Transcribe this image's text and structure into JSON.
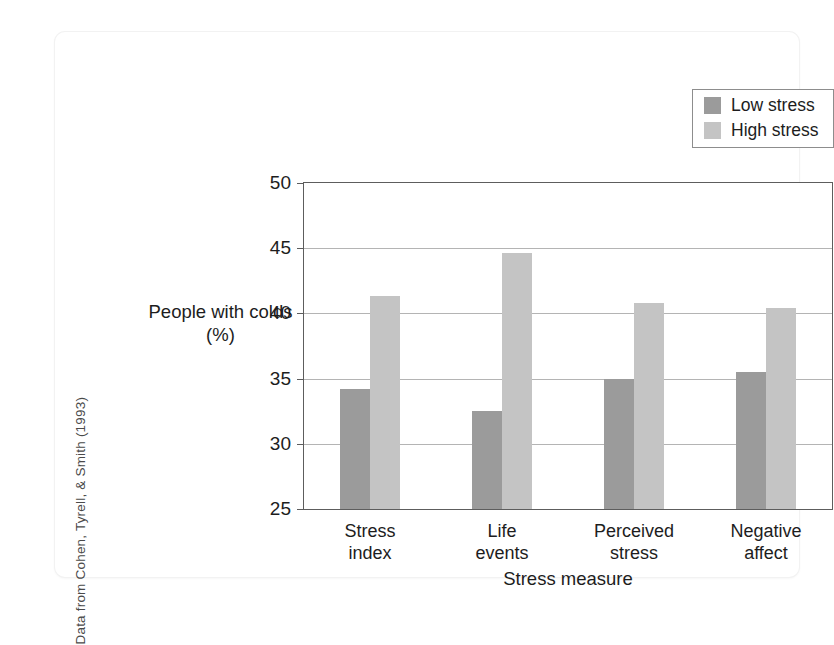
{
  "source_credit": "Data from Cohen, Tyrell, & Smith (1993)",
  "legend": {
    "position": "top-right",
    "items": [
      {
        "label": "Low stress",
        "color": "#9b9b9b",
        "swatch_name": "legend-swatch-low-stress"
      },
      {
        "label": "High stress",
        "color": "#c4c4c4",
        "swatch_name": "legend-swatch-high-stress"
      }
    ]
  },
  "chart_data": {
    "type": "bar",
    "title": "",
    "subtitle": "",
    "xlabel": "Stress measure",
    "ylabel": "People with colds (%)",
    "categories": [
      "Stress\nindex",
      "Life\nevents",
      "Perceived\nstress",
      "Negative\naffect"
    ],
    "category_labels": [
      {
        "line1": "Stress",
        "line2": "index"
      },
      {
        "line1": "Life",
        "line2": "events"
      },
      {
        "line1": "Perceived",
        "line2": "stress"
      },
      {
        "line1": "Negative",
        "line2": "affect"
      }
    ],
    "series": [
      {
        "name": "Low stress",
        "color": "#9b9b9b",
        "values": [
          34.2,
          32.5,
          35.0,
          35.5
        ]
      },
      {
        "name": "High stress",
        "color": "#c4c4c4",
        "values": [
          41.3,
          44.6,
          40.8,
          40.4
        ]
      }
    ],
    "ylim": [
      25,
      50
    ],
    "yticks": [
      50,
      45,
      40,
      35,
      30,
      25
    ],
    "ytick_labels": [
      "50",
      "45",
      "40",
      "35",
      "30",
      "25"
    ],
    "grid": true,
    "grid_axis": "y",
    "legend_position": "top-right"
  }
}
